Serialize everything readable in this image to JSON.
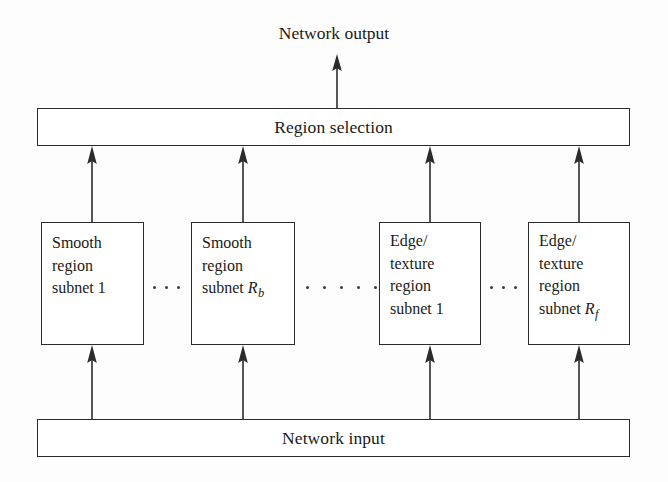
{
  "diagram": {
    "background_color": "#fdfdfd",
    "line_color": "#2b2b2b",
    "text_color": "#1a1a1a",
    "output_label": "Network output",
    "input_label": "Network input",
    "selection_label": "Region selection",
    "subnets": [
      {
        "id": "smooth-1",
        "lines": [
          "Smooth",
          "region",
          "subnet 1"
        ],
        "text": "Smooth region subnet 1",
        "variable": "",
        "variable_subscript": ""
      },
      {
        "id": "smooth-rb",
        "lines": [
          "Smooth",
          "region",
          "subnet "
        ],
        "text": "Smooth region subnet R_b",
        "variable": "R",
        "variable_subscript": "b"
      },
      {
        "id": "edge-texture-1",
        "lines": [
          "Edge/",
          "texture",
          "region",
          "subnet 1"
        ],
        "text": "Edge/ texture region subnet 1",
        "variable": "",
        "variable_subscript": ""
      },
      {
        "id": "edge-texture-rf",
        "lines": [
          "Edge/",
          "texture",
          "region",
          "subnet "
        ],
        "text": "Edge/ texture region subnet R_f",
        "variable": "R",
        "variable_subscript": "f"
      }
    ],
    "ellipses": [
      {
        "id": "gap-smooth",
        "dot_count": 3
      },
      {
        "id": "gap-middle",
        "dot_count": 5
      },
      {
        "id": "gap-edge",
        "dot_count": 3
      }
    ],
    "arrows": {
      "output_arrow": "up-arrow-to-network-output",
      "selection_arrows": 4,
      "input_arrows": 4
    }
  }
}
